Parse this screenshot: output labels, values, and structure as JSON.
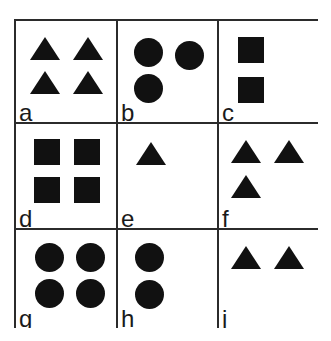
{
  "figure": {
    "shape_color": "#111111",
    "line_color": "#2b2b2b",
    "background_color": "#ffffff",
    "rows": 3,
    "columns": 3
  },
  "cells": [
    {
      "label": "a",
      "shape_type": "triangle",
      "count": 4,
      "arrangement": "2x2 grid",
      "positions": [
        {
          "x": 14,
          "y": 16
        },
        {
          "x": 57,
          "y": 16
        },
        {
          "x": 14,
          "y": 50
        },
        {
          "x": 57,
          "y": 50
        }
      ]
    },
    {
      "label": "b",
      "shape_type": "circle",
      "count": 3,
      "arrangement": "two top, one bottom-left",
      "positions": [
        {
          "x": 16,
          "y": 17
        },
        {
          "x": 57,
          "y": 20
        },
        {
          "x": 16,
          "y": 53
        }
      ]
    },
    {
      "label": "c",
      "shape_type": "square",
      "count": 2,
      "arrangement": "vertical pair",
      "positions": [
        {
          "x": 19,
          "y": 16
        },
        {
          "x": 19,
          "y": 56
        }
      ]
    },
    {
      "label": "d",
      "shape_type": "square",
      "count": 4,
      "arrangement": "2x2 grid",
      "positions": [
        {
          "x": 18,
          "y": 15
        },
        {
          "x": 58,
          "y": 15
        },
        {
          "x": 18,
          "y": 53
        },
        {
          "x": 58,
          "y": 53
        }
      ]
    },
    {
      "label": "e",
      "shape_type": "triangle",
      "count": 1,
      "arrangement": "single, upper left",
      "positions": [
        {
          "x": 18,
          "y": 18
        }
      ]
    },
    {
      "label": "f",
      "shape_type": "triangle",
      "count": 3,
      "arrangement": "two top, one bottom-left",
      "positions": [
        {
          "x": 12,
          "y": 16
        },
        {
          "x": 55,
          "y": 16
        },
        {
          "x": 12,
          "y": 51
        }
      ]
    },
    {
      "label": "g",
      "shape_type": "circle",
      "count": 4,
      "arrangement": "2x2 grid",
      "positions": [
        {
          "x": 19,
          "y": 13
        },
        {
          "x": 60,
          "y": 13
        },
        {
          "x": 19,
          "y": 49
        },
        {
          "x": 60,
          "y": 49
        }
      ]
    },
    {
      "label": "h",
      "shape_type": "circle",
      "count": 2,
      "arrangement": "vertical pair",
      "positions": [
        {
          "x": 17,
          "y": 13
        },
        {
          "x": 17,
          "y": 50
        }
      ]
    },
    {
      "label": "j",
      "shape_type": "triangle",
      "count": 2,
      "arrangement": "horizontal pair",
      "positions": [
        {
          "x": 12,
          "y": 16
        },
        {
          "x": 55,
          "y": 16
        }
      ]
    }
  ],
  "shape_sizes": {
    "circle_diameter": 29,
    "square_side": 26,
    "triangle_width": 30,
    "triangle_height": 23
  }
}
